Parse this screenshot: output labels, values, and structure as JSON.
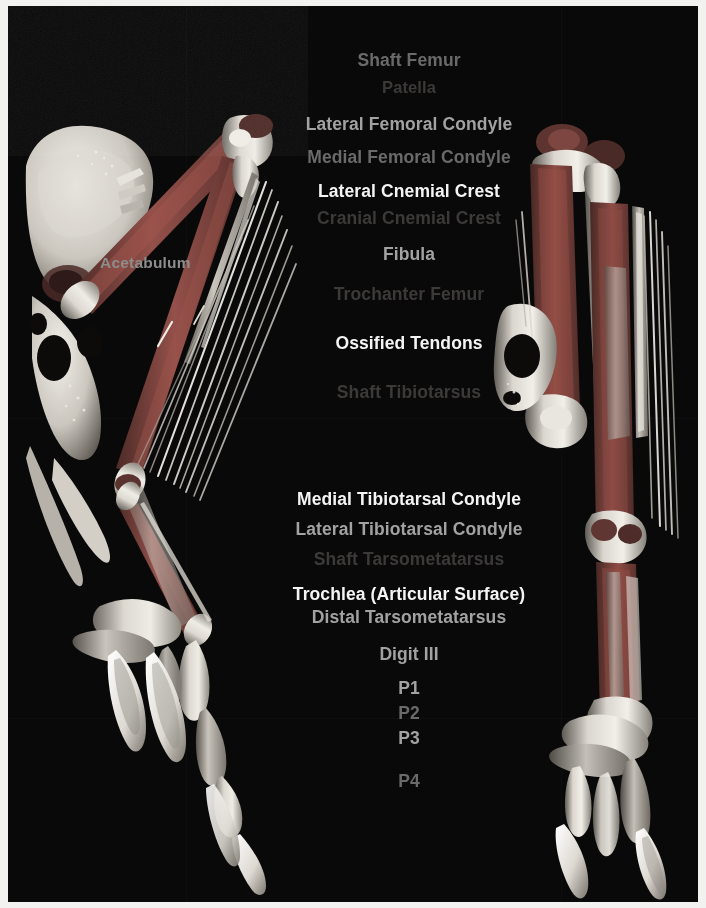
{
  "figure": {
    "background_color": "#0a0909",
    "border_color": "#f2f2f0",
    "width": 706,
    "height": 908
  },
  "palette": {
    "bright": "#f4f4f4",
    "mid": "#a2a2a2",
    "dim": "#6a6a6a",
    "faint": "#3c3a38",
    "bone_light": "#e8e6e0",
    "bone_mid": "#b9b5ad",
    "bone_shadow": "#6e6a63",
    "tissue_red": "#8a4740",
    "tissue_dark": "#4a2a27"
  },
  "specimens": [
    {
      "name": "left-specimen",
      "view": "lateral",
      "caption": ""
    },
    {
      "name": "right-specimen",
      "view": "cranial",
      "caption": ""
    }
  ],
  "overlay_labels": [
    {
      "id": "acetabulum",
      "text": "Acetabulum",
      "tier": "mid"
    }
  ],
  "annotations": [
    {
      "id": "shaft-femur",
      "text": "Shaft Femur",
      "y": 44,
      "tier": "dim",
      "size": "lg"
    },
    {
      "id": "patella",
      "text": "Patella",
      "y": 72,
      "tier": "faint",
      "size": "md"
    },
    {
      "id": "lateral-femoral-condyle",
      "text": "Lateral Femoral Condyle",
      "y": 108,
      "tier": "mid",
      "size": "lg"
    },
    {
      "id": "medial-femoral-condyle",
      "text": "Medial Femoral Condyle",
      "y": 141,
      "tier": "dim",
      "size": "lg"
    },
    {
      "id": "lateral-cnemial-crest",
      "text": "Lateral Cnemial Crest",
      "y": 175,
      "tier": "bright",
      "size": "lg"
    },
    {
      "id": "cranial-cnemial-crest",
      "text": "Cranial Cnemial Crest",
      "y": 202,
      "tier": "faint",
      "size": "lg"
    },
    {
      "id": "fibula",
      "text": "Fibula",
      "y": 238,
      "tier": "mid",
      "size": "lg"
    },
    {
      "id": "trochanter-femur",
      "text": "Trochanter Femur",
      "y": 278,
      "tier": "faint",
      "size": "lg"
    },
    {
      "id": "ossified-tendons",
      "text": "Ossified Tendons",
      "y": 327,
      "tier": "bright",
      "size": "lg"
    },
    {
      "id": "shaft-tibiotarsus",
      "text": "Shaft Tibiotarsus",
      "y": 376,
      "tier": "faint",
      "size": "lg"
    },
    {
      "id": "medial-tibiotarsal-condyle",
      "text": "Medial Tibiotarsal Condyle",
      "y": 483,
      "tier": "bright",
      "size": "lg"
    },
    {
      "id": "lateral-tibiotarsal-condyle",
      "text": "Lateral Tibiotarsal Condyle",
      "y": 513,
      "tier": "mid",
      "size": "lg"
    },
    {
      "id": "shaft-tarsometatarsus",
      "text": "Shaft Tarsometatarsus",
      "y": 543,
      "tier": "faint",
      "size": "lg"
    },
    {
      "id": "trochlea-articular-surface",
      "text": "Trochlea (Articular Surface)",
      "y": 578,
      "tier": "bright",
      "size": "lg"
    },
    {
      "id": "distal-tarsometatarsus",
      "text": "Distal Tarsometatarsus",
      "y": 601,
      "tier": "mid",
      "size": "lg"
    },
    {
      "id": "digit-iii",
      "text": "Digit III",
      "y": 638,
      "tier": "mid",
      "size": "lg"
    },
    {
      "id": "phalanx-1",
      "text": "P1",
      "y": 672,
      "tier": "mid",
      "size": "lg"
    },
    {
      "id": "phalanx-2",
      "text": "P2",
      "y": 697,
      "tier": "dim",
      "size": "lg"
    },
    {
      "id": "phalanx-3",
      "text": "P3",
      "y": 722,
      "tier": "mid",
      "size": "lg"
    },
    {
      "id": "phalanx-4",
      "text": "P4",
      "y": 765,
      "tier": "dim",
      "size": "lg"
    }
  ]
}
